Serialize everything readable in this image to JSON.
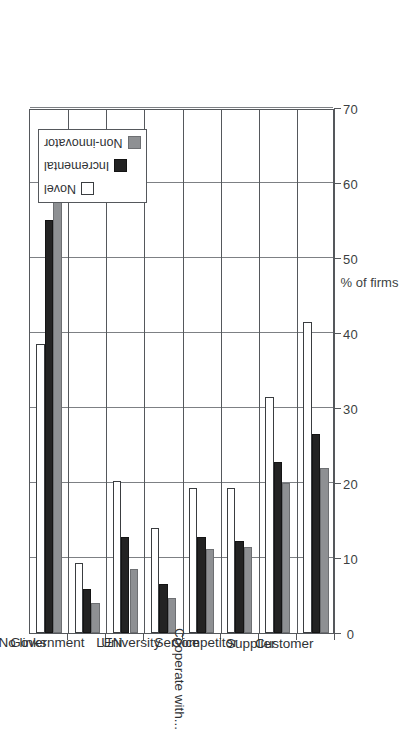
{
  "chart_data": {
    "type": "bar",
    "orientation": "vertical-rotated",
    "title": "",
    "xlabel": "Cooperate with...",
    "ylabel": "% of firms",
    "ylim": [
      0,
      70
    ],
    "yticks": [
      "0",
      "10",
      "20",
      "30",
      "40",
      "50",
      "60",
      "70"
    ],
    "grid": true,
    "legend_position": "top-right",
    "categories": [
      "No links",
      "Government",
      "LEN",
      "University",
      "Service",
      "Competitor",
      "Supplier",
      "Customer"
    ],
    "series": [
      {
        "name": "Novel",
        "color": "#ffffff",
        "values": [
          38.5,
          9.3,
          20.3,
          14.0,
          19.3,
          19.3,
          31.5,
          41.5
        ]
      },
      {
        "name": "Incremental",
        "color": "#232323",
        "values": [
          55.0,
          5.8,
          12.8,
          6.5,
          12.8,
          12.2,
          22.8,
          26.5
        ]
      },
      {
        "name": "Non-innovator",
        "color": "#8e9093",
        "values": [
          61.5,
          4.0,
          8.5,
          4.7,
          11.2,
          11.5,
          20.0,
          22.0
        ]
      }
    ]
  },
  "legend": {
    "entries": [
      {
        "label": "Novel",
        "swatch": "novel"
      },
      {
        "label": "Incremental",
        "swatch": "incremental"
      },
      {
        "label": "Non-innovator",
        "swatch": "noninnov"
      }
    ]
  },
  "axes": {
    "value_axis_title": "% of firms",
    "category_axis_title": "Cooperate with..."
  }
}
